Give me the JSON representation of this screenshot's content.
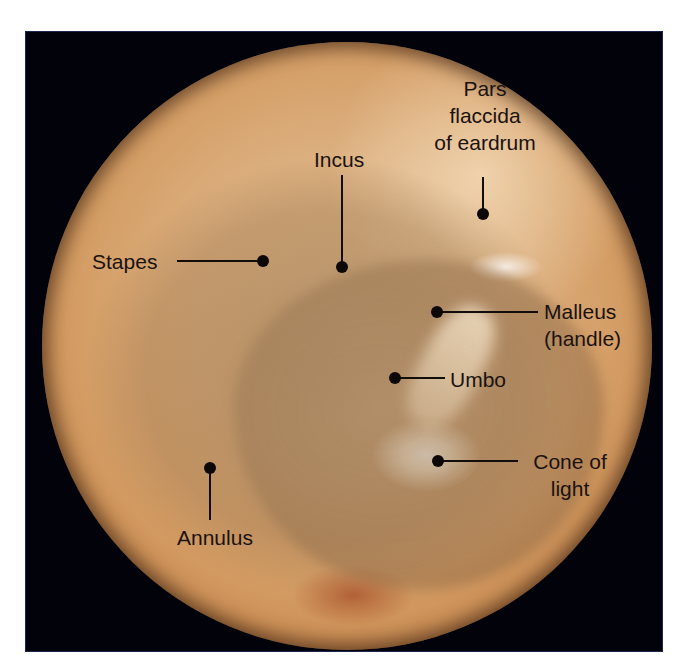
{
  "figure": {
    "background_color": "#ffffff",
    "frame_color": "#02030a",
    "eardrum_colors": {
      "light": "#e6c396",
      "mid": "#d39b62",
      "dark": "#9b5a2a"
    },
    "annotation_color": "#1a1210"
  },
  "labels": {
    "pars_flaccida": {
      "line1": "Pars",
      "line2": "flaccida",
      "line3": "of eardrum"
    },
    "incus": "Incus",
    "stapes": "Stapes",
    "malleus": {
      "line1": "Malleus",
      "line2": "(handle)"
    },
    "umbo": "Umbo",
    "cone_of_light": {
      "line1": "Cone of",
      "line2": "light"
    },
    "annulus": "Annulus"
  }
}
